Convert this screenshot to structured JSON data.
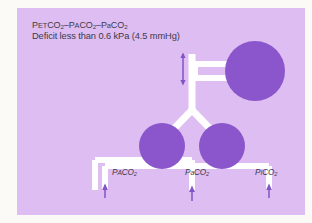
{
  "figure": {
    "background_color": "#fbfaf7",
    "panel_color": "#ddbdf2",
    "accent_color": "#8b55cc",
    "tube_color": "#ffffff",
    "text_color": "#3d3a4a"
  },
  "caption": {
    "line1_prefix": "P",
    "line1_sc1": "ET",
    "line1_mid1": "CO",
    "line1_sub1": "2",
    "line1_dash1": "–P",
    "line1_sc2": "A",
    "line1_mid2": "CO",
    "line1_sub2": "2",
    "line1_dash2": "–P",
    "line1_sc3": "a",
    "line1_mid3": "CO",
    "line1_sub3": "2",
    "line1_full": "PETCO2–PACO2–PaCO2",
    "line2": "Deficit less than 0.6 kPa (4.5 mmHg)"
  },
  "labels": [
    {
      "id": "label-paco2-alveolar",
      "prefix": "P",
      "smallcap": "A",
      "mid": "CO",
      "sub": "2",
      "full": "PACO2"
    },
    {
      "id": "label-paco2-arterial",
      "prefix": "P",
      "smallcap": "a",
      "mid": "CO",
      "sub": "2",
      "full": "PaCO2"
    },
    {
      "id": "label-pico2-inspired",
      "prefix": "P",
      "smallcap": "I",
      "mid": "CO",
      "sub": "2",
      "full": "PICO2"
    }
  ],
  "diagram": {
    "type": "schematic",
    "shapes": {
      "balloon_right": {
        "cx": 238,
        "cy": 63,
        "r": 30
      },
      "alveolus_left": {
        "cx": 145,
        "cy": 138,
        "r": 23
      },
      "alveolus_right": {
        "cx": 205,
        "cy": 138,
        "r": 23
      }
    },
    "arrows": {
      "gradient_arrow": "double-headed vertical arrow at airway",
      "measurement_arrows": 3,
      "measurement_arrow_direction": "up"
    }
  }
}
